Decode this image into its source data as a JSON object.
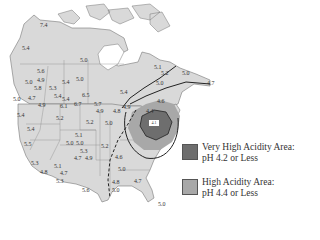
{
  "map": {
    "type": "choropleth",
    "subject": "Precipitation pH across North America",
    "legend": [
      {
        "label_line1": "Very High Acidity Area:",
        "label_line2": "pH 4.2 or Less",
        "color": "#6e6e6e"
      },
      {
        "label_line1": "High Acidity Area:",
        "label_line2": "pH 4.4 or Less",
        "color": "#a8a8a8"
      }
    ],
    "colors": {
      "land": "#d9d9d9",
      "border": "#777777",
      "contour": "#222222",
      "water": "#ffffff"
    },
    "center_tag": "4.1",
    "ph_labels": [
      {
        "v": "7.4",
        "x": 40,
        "y": 22
      },
      {
        "v": "5.4",
        "x": 22,
        "y": 45
      },
      {
        "v": "5.0",
        "x": 80,
        "y": 57
      },
      {
        "v": "5.6",
        "x": 37,
        "y": 68
      },
      {
        "v": "5.0",
        "x": 25,
        "y": 79
      },
      {
        "v": "4.9",
        "x": 37,
        "y": 77
      },
      {
        "v": "5.8",
        "x": 34,
        "y": 85
      },
      {
        "v": "5.3",
        "x": 49,
        "y": 85
      },
      {
        "v": "5.4",
        "x": 62,
        "y": 79
      },
      {
        "v": "5.0",
        "x": 76,
        "y": 76
      },
      {
        "v": "5.4",
        "x": 54,
        "y": 93
      },
      {
        "v": "5.4",
        "x": 62,
        "y": 96
      },
      {
        "v": "6.5",
        "x": 82,
        "y": 92
      },
      {
        "v": "5.0",
        "x": 13,
        "y": 96
      },
      {
        "v": "4.7",
        "x": 28,
        "y": 95
      },
      {
        "v": "4.9",
        "x": 38,
        "y": 102
      },
      {
        "v": "6.1",
        "x": 60,
        "y": 103
      },
      {
        "v": "6.7",
        "x": 74,
        "y": 101
      },
      {
        "v": "5.7",
        "x": 94,
        "y": 101
      },
      {
        "v": "4.9",
        "x": 96,
        "y": 108
      },
      {
        "v": "4.8",
        "x": 113,
        "y": 108
      },
      {
        "v": "4.9",
        "x": 123,
        "y": 104
      },
      {
        "v": "5.4",
        "x": 120,
        "y": 89
      },
      {
        "v": "5.4",
        "x": 17,
        "y": 112
      },
      {
        "v": "5.2",
        "x": 56,
        "y": 115
      },
      {
        "v": "5.2",
        "x": 86,
        "y": 119
      },
      {
        "v": "5.0",
        "x": 105,
        "y": 120
      },
      {
        "v": "5.4",
        "x": 27,
        "y": 126
      },
      {
        "v": "5.1",
        "x": 75,
        "y": 132
      },
      {
        "v": "5.0",
        "x": 66,
        "y": 140
      },
      {
        "v": "5.0",
        "x": 76,
        "y": 140
      },
      {
        "v": "5.2",
        "x": 101,
        "y": 143
      },
      {
        "v": "5.5",
        "x": 24,
        "y": 141
      },
      {
        "v": "5.3",
        "x": 80,
        "y": 148
      },
      {
        "v": "4.7",
        "x": 74,
        "y": 155
      },
      {
        "v": "4.9",
        "x": 85,
        "y": 155
      },
      {
        "v": "4.6",
        "x": 115,
        "y": 154
      },
      {
        "v": "5.3",
        "x": 31,
        "y": 160
      },
      {
        "v": "4.8",
        "x": 40,
        "y": 169
      },
      {
        "v": "5.1",
        "x": 54,
        "y": 163
      },
      {
        "v": "4.7",
        "x": 60,
        "y": 170
      },
      {
        "v": "5.3",
        "x": 56,
        "y": 178
      },
      {
        "v": "5.0",
        "x": 118,
        "y": 166
      },
      {
        "v": "4.8",
        "x": 112,
        "y": 179
      },
      {
        "v": "5.0",
        "x": 112,
        "y": 187
      },
      {
        "v": "4.7",
        "x": 134,
        "y": 178
      },
      {
        "v": "5.6",
        "x": 82,
        "y": 187
      },
      {
        "v": "5.1",
        "x": 154,
        "y": 64
      },
      {
        "v": "5.2",
        "x": 161,
        "y": 70
      },
      {
        "v": "5.0",
        "x": 156,
        "y": 80
      },
      {
        "v": "5.0",
        "x": 182,
        "y": 70
      },
      {
        "v": "4.6",
        "x": 157,
        "y": 98
      },
      {
        "v": "4.4",
        "x": 146,
        "y": 108
      },
      {
        "v": "4.7",
        "x": 207,
        "y": 80
      },
      {
        "v": "5.0",
        "x": 158,
        "y": 201
      }
    ]
  }
}
